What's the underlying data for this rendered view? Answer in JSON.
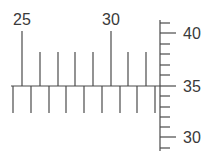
{
  "colors": {
    "line": "#4a4a4a",
    "text": "#3a3a3a",
    "background": "#ffffff"
  },
  "horizontal_scale": {
    "labels": [
      {
        "text": "25",
        "x": 22
      },
      {
        "text": "30",
        "x": 111
      }
    ],
    "upper_ticks": [
      {
        "x": 22,
        "major": true
      },
      {
        "x": 40,
        "major": false
      },
      {
        "x": 58,
        "major": false
      },
      {
        "x": 75,
        "major": false
      },
      {
        "x": 93,
        "major": false
      },
      {
        "x": 111,
        "major": true
      },
      {
        "x": 128,
        "major": false
      },
      {
        "x": 146,
        "major": false
      }
    ],
    "lower_ticks": [
      13,
      31,
      49,
      66,
      84,
      102,
      120,
      137,
      155
    ]
  },
  "vertical_scale": {
    "labels": [
      {
        "text": "40",
        "y": 33
      },
      {
        "text": "35",
        "y": 86
      },
      {
        "text": "30",
        "y": 137
      }
    ],
    "ticks": [
      {
        "y": 23,
        "major": false
      },
      {
        "y": 33,
        "major": true
      },
      {
        "y": 44,
        "major": false
      },
      {
        "y": 54,
        "major": false
      },
      {
        "y": 65,
        "major": false
      },
      {
        "y": 75,
        "major": false
      },
      {
        "y": 86,
        "major": true
      },
      {
        "y": 96,
        "major": false
      },
      {
        "y": 107,
        "major": false
      },
      {
        "y": 117,
        "major": false
      },
      {
        "y": 127,
        "major": false
      },
      {
        "y": 137,
        "major": true
      },
      {
        "y": 148,
        "major": false
      }
    ]
  }
}
